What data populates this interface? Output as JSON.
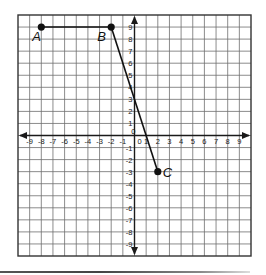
{
  "chart_data": {
    "type": "scatter",
    "title": "",
    "xlabel": "",
    "ylabel": "",
    "xlim": [
      -10,
      10
    ],
    "ylim": [
      -10,
      10
    ],
    "grid": true,
    "x_tick_labels": [
      "-9",
      "-8",
      "-7",
      "-6",
      "-5",
      "-4",
      "-3",
      "-2",
      "-1",
      "0",
      "1",
      "2",
      "3",
      "4",
      "5",
      "6",
      "7",
      "8",
      "9"
    ],
    "y_tick_labels_positive": [
      "1",
      "2",
      "3",
      "4",
      "5",
      "6",
      "7",
      "8",
      "9"
    ],
    "y_tick_labels_negative": [
      "-1",
      "-2",
      "-3",
      "-4",
      "-5",
      "-6",
      "-7",
      "-8",
      "-9"
    ],
    "origin_label": "0",
    "points": [
      {
        "label": "A",
        "x": -8,
        "y": 9
      },
      {
        "label": "B",
        "x": -2,
        "y": 9
      },
      {
        "label": "C",
        "x": 2,
        "y": -3
      }
    ],
    "segments": [
      {
        "from": "A",
        "to": "B"
      },
      {
        "from": "B",
        "to": "C"
      }
    ]
  },
  "colors": {
    "grid": "#6e6e6e",
    "axis": "#1a1a1a",
    "ink": "#111111",
    "background": "#ffffff"
  }
}
